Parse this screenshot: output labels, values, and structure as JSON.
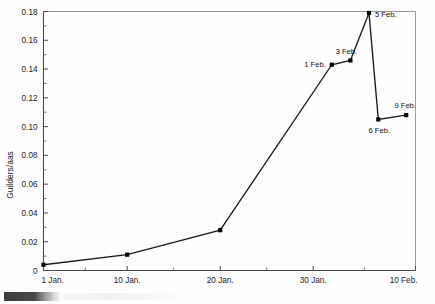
{
  "chart_data": {
    "type": "line",
    "title": "",
    "subtitle": "",
    "xlabel": "",
    "ylabel": "Guilders/aas",
    "ylim": [
      0,
      0.18
    ],
    "xlim": [
      0,
      40
    ],
    "grid": false,
    "legend": "none",
    "y_ticks": [
      "0",
      "0.02",
      "0.04",
      "0.06",
      "0.08",
      "0.10",
      "0.12",
      "0.14",
      "0.16",
      "0.18"
    ],
    "y_tick_values": [
      0,
      0.02,
      0.04,
      0.06,
      0.08,
      0.1,
      0.12,
      0.14,
      0.16,
      0.18
    ],
    "y_minor_tick_values": [
      0.01,
      0.03,
      0.05,
      0.07,
      0.09,
      0.11,
      0.13,
      0.15,
      0.17
    ],
    "x_ticks": [
      "1 Jan.",
      "10 Jan.",
      "20 Jan.",
      "30 Jan.",
      "10 Feb."
    ],
    "x_tick_values": [
      0,
      9,
      19,
      29,
      40
    ],
    "x_minor_tick_values": [
      4.5,
      14,
      24,
      34.5
    ],
    "x": [
      0,
      9,
      19,
      31,
      33,
      35,
      36,
      39
    ],
    "values": [
      0.004,
      0.011,
      0.028,
      0.143,
      0.146,
      0.179,
      0.105,
      0.108
    ],
    "point_labels": [
      "",
      "",
      "",
      "1 Feb.",
      "3 Feb.",
      "5 Feb.",
      "6 Feb.",
      "9 Feb."
    ],
    "series": [
      {
        "name": "Tulip bulb price",
        "values": [
          0.004,
          0.011,
          0.028,
          0.143,
          0.146,
          0.179,
          0.105,
          0.108
        ]
      }
    ],
    "line_color": "#1a1a1a",
    "marker_color": "#000000",
    "frame_color": "#888888"
  },
  "figure": {
    "caption_fragment": ""
  }
}
